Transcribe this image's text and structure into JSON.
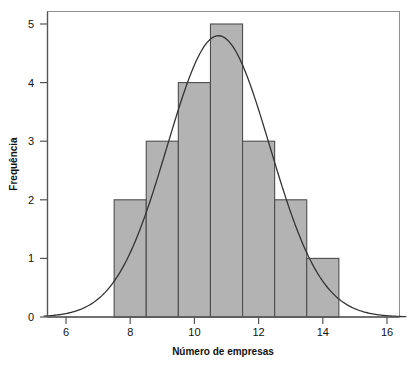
{
  "chart_data": {
    "type": "bar",
    "title": "",
    "subtitle": "",
    "xlabel": "Número de empresas",
    "ylabel": "Frequência",
    "xlim": [
      5.3,
      16.6
    ],
    "ylim": [
      0,
      5.25
    ],
    "xticks": [
      6,
      8,
      10,
      12,
      14,
      16
    ],
    "xtick_labels": [
      "6",
      "8",
      "10",
      "12",
      "14",
      "16"
    ],
    "yticks": [
      0,
      1,
      2,
      3,
      4,
      5
    ],
    "ytick_labels": [
      "0",
      "1",
      "2",
      "3",
      "4",
      "5"
    ],
    "grid": false,
    "legend": null,
    "bin_edges": [
      7.5,
      8.5,
      9.5,
      10.5,
      11.5,
      12.5,
      13.5,
      14.5
    ],
    "bin_centers": [
      8,
      9,
      10,
      11,
      12,
      13,
      14
    ],
    "categories": [
      "7.5-8.5",
      "8.5-9.5",
      "9.5-10.5",
      "10.5-11.5",
      "11.5-12.5",
      "12.5-13.5",
      "13.5-14.5"
    ],
    "values": [
      2,
      3,
      4,
      5,
      3,
      2,
      1
    ],
    "bar_fill": "#b3b3b3",
    "bar_edge": "#4d4d4d",
    "overlay": {
      "type": "line",
      "name": "normal-curve",
      "color": "#333333",
      "mean": 10.75,
      "stddev": 1.6,
      "peak_value": 4.8,
      "peak_x": 10.75
    },
    "frame_color": "#808080",
    "axis_color": "#555555"
  },
  "axes": {
    "x_axis_title": "Número de empresas",
    "y_axis_title": "Frequência"
  }
}
